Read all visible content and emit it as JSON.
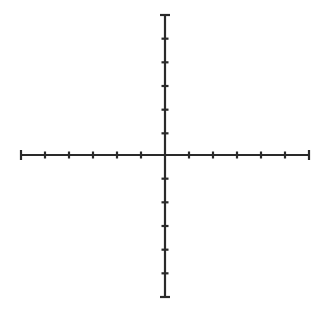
{
  "figure": {
    "canvas": {
      "width": 328,
      "height": 313,
      "background_color": "#ffffff"
    },
    "style": {
      "line_color": "#2a2a2a",
      "axis_stroke_width": 2.2,
      "tick_stroke_width": 2.2,
      "tick_half_length": 3.5,
      "end_cap_half_length": 5
    }
  },
  "chart_data": {
    "type": "line",
    "subtitle": "",
    "xlabel": "",
    "ylabel": "",
    "grid": false,
    "legend": null,
    "origin": {
      "x": 165,
      "y": 155
    },
    "xlim": [
      -6,
      6
    ],
    "ylim": [
      -6,
      6
    ],
    "x_tick_values": [
      -6,
      -5,
      -4,
      -3,
      -2,
      -1,
      0,
      1,
      2,
      3,
      4,
      5,
      6
    ],
    "y_tick_values": [
      -6,
      -5,
      -4,
      -3,
      -2,
      -1,
      0,
      1,
      2,
      3,
      4,
      5,
      6
    ],
    "x_tick_labels": [
      "",
      "",
      "",
      "",
      "",
      "",
      "",
      "",
      "",
      "",
      "",
      "",
      ""
    ],
    "y_tick_labels": [
      "",
      "",
      "",
      "",
      "",
      "",
      "",
      "",
      "",
      "",
      "",
      "",
      ""
    ],
    "x_tick_pixels": [
      21,
      45,
      69,
      93,
      117,
      141,
      165,
      189,
      213,
      237,
      261,
      285,
      309
    ],
    "y_tick_pixels": [
      15,
      38.67,
      62.33,
      86,
      109.67,
      133.33,
      155,
      178.67,
      202.33,
      226,
      249.67,
      273.33,
      297
    ],
    "x_axis_pixel_span": [
      21,
      309
    ],
    "y_axis_pixel_span": [
      15,
      297
    ],
    "x_tick_spacing_px": 24,
    "y_tick_spacing_px": 23.67,
    "tick_count_per_side": 6,
    "series": [],
    "data_points": [],
    "annotations": []
  },
  "axes": {
    "horizontal": {
      "name": "x-axis",
      "y_pixel": 155,
      "start_pixel": 21,
      "end_pixel": 309
    },
    "vertical": {
      "name": "y-axis",
      "x_pixel": 165,
      "start_pixel": 15,
      "end_pixel": 297
    }
  }
}
